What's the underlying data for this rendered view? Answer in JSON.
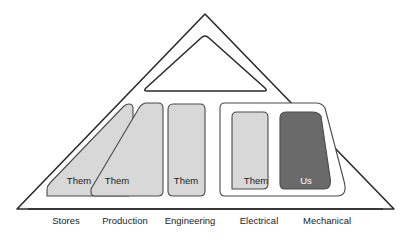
{
  "figure": {
    "type": "diagram",
    "background_color": "#ffffff",
    "outline_color": "#2b2b2b",
    "silo_fill_them": "#d8d8d8",
    "silo_fill_us": "#6a6a6a",
    "silo_border_color": "#4a4a4a",
    "container_fill": "#ffffff"
  },
  "apex": {
    "name": "management-apex",
    "label": ""
  },
  "silos": [
    {
      "id": "stores",
      "axis_label": "Stores",
      "silo_label": "Them",
      "fill": "#d8d8d8",
      "label_x": 79,
      "label_y": 181,
      "axis_label_x": 66,
      "axis_label_y": 221,
      "path": "M 47 196 L 47 190 Q 47 186 50 183 L 123 107 Q 126 104 129 104 Q 133 104 133 108 L 133 190 Q 133 196 127 196 Z"
    },
    {
      "id": "production",
      "axis_label": "Production",
      "silo_label": "Them",
      "fill": "#d8d8d8",
      "label_x": 117,
      "label_y": 181,
      "axis_label_x": 125,
      "axis_label_y": 221,
      "path": "M 95 196 Q 91 196 91 192 L 91 189 L 139 108 Q 142 103 147 103 L 158 103 Q 163 103 163 108 L 163 191 Q 163 196 158 196 Z"
    },
    {
      "id": "engineering",
      "axis_label": "Engineering",
      "silo_label": "Them",
      "fill": "#d8d8d8",
      "label_x": 186,
      "label_y": 181,
      "axis_label_x": 190,
      "axis_label_y": 221,
      "path": "M 173 196 Q 168 196 168 191 L 168 110 Q 168 104 173 104 L 200 104 Q 205 104 205 109 L 205 191 Q 205 196 200 196 Z"
    },
    {
      "id": "electrical",
      "axis_label": "Electrical",
      "silo_label": "Them",
      "fill": "#d8d8d8",
      "label_x": 256,
      "label_y": 181,
      "axis_label_x": 259,
      "axis_label_y": 221,
      "path": "M 232 189 Q 232 185 232 184 L 232 117 Q 232 112 237 112 L 263 112 Q 268 112 268 117 L 268 184 Q 268 189 263 189 L 237 189 Z"
    },
    {
      "id": "mechanical",
      "axis_label": "Mechanical",
      "silo_label": "Us",
      "fill": "#6a6a6a",
      "label_x": 306,
      "label_y": 181,
      "axis_label_x": 327,
      "axis_label_y": 221,
      "path": "M 285 189 Q 280 189 280 184 L 280 118 Q 280 112 286 112 L 312 112 Q 318 112 321 116 L 330 177 Q 332 189 324 189 Z"
    }
  ],
  "group_container": {
    "name": "electrical-mechanical-container",
    "path": "M 225 196 Q 220 196 220 191 L 220 108 Q 220 103 225 103 L 316 103 Q 322 103 325 108 L 344 181 Q 348 196 337 196 Z"
  },
  "triangle": {
    "outer_path": "M 205 14 L 394 209 L 17 209 Z",
    "inner_path": "M 205 36 Q 207 36 209 38 L 265 88 Q 268 91 264 91 L 147 91 Q 143 91 146 88 L 201 38 Q 203 36 205 36 Z",
    "baseline": {
      "x1": 28,
      "y1": 209,
      "x2": 383,
      "y2": 209
    }
  }
}
